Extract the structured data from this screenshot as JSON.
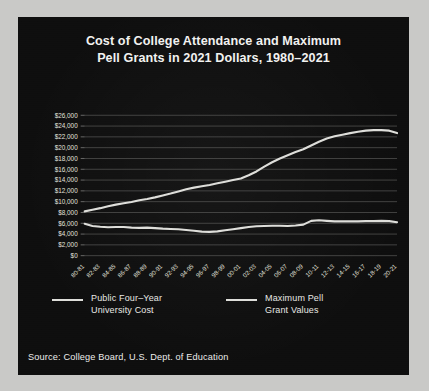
{
  "figure": {
    "border_color": "#c9c9c7",
    "background_color": "#0d0d0d"
  },
  "title": {
    "line1": "Cost of College Attendance and Maximum",
    "line2": "Pell Grants in 2021 Dollars, 1980–2021"
  },
  "source": "Source: College Board, U.S. Dept. of Education",
  "legend": {
    "items": [
      {
        "label_line1": "Public Four–Year",
        "label_line2": "University Cost",
        "color": "#dedeDa"
      },
      {
        "label_line1": "Maximum Pell",
        "label_line2": "Grant Values",
        "color": "#dedeDa"
      }
    ]
  },
  "chart_data": {
    "type": "line",
    "title": "Cost of College Attendance and Maximum Pell Grants in 2021 Dollars, 1980–2021",
    "xlabel": "",
    "ylabel": "",
    "ylim": [
      0,
      26000
    ],
    "ytick_values": [
      0,
      2000,
      4000,
      6000,
      8000,
      10000,
      12000,
      14000,
      16000,
      18000,
      20000,
      22000,
      24000,
      26000
    ],
    "ytick_labels": [
      "$0",
      "$2,000",
      "$4,000",
      "$6,000",
      "$8,000",
      "$10,000",
      "$12,000",
      "$14,000",
      "$16,000",
      "$18,000",
      "$20,000",
      "$22,000",
      "$24,000",
      "$26,000"
    ],
    "grid": true,
    "legend_position": "below-axes",
    "categories": [
      "80-81",
      "81-82",
      "82-83",
      "83-84",
      "84-85",
      "85-86",
      "86-87",
      "87-88",
      "88-89",
      "89-90",
      "90-91",
      "91-92",
      "92-93",
      "93-94",
      "94-95",
      "95-96",
      "96-97",
      "97-98",
      "98-99",
      "99-00",
      "00-01",
      "01-02",
      "02-03",
      "03-04",
      "04-05",
      "05-06",
      "06-07",
      "07-08",
      "08-09",
      "09-10",
      "10-11",
      "11-12",
      "12-13",
      "13-14",
      "14-15",
      "15-16",
      "16-17",
      "17-18",
      "18-19",
      "19-20",
      "20-21"
    ],
    "xtick_labels": [
      "80-81",
      "82-83",
      "84-85",
      "86-87",
      "88-89",
      "90-91",
      "92-93",
      "94-95",
      "96-97",
      "98-99",
      "00-01",
      "02-03",
      "04-05",
      "06-07",
      "08-09",
      "10-11",
      "12-13",
      "14-15",
      "16-17",
      "18-19",
      "20-21"
    ],
    "series": [
      {
        "name": "Public Four-Year University Cost",
        "color": "#dedeDa",
        "values": [
          8200,
          8500,
          8800,
          9150,
          9450,
          9700,
          9950,
          10250,
          10500,
          10800,
          11150,
          11500,
          11900,
          12300,
          12600,
          12850,
          13100,
          13400,
          13700,
          14000,
          14300,
          14900,
          15600,
          16500,
          17300,
          18000,
          18600,
          19200,
          19700,
          20400,
          21100,
          21700,
          22100,
          22400,
          22700,
          22950,
          23150,
          23250,
          23250,
          23150,
          22700
        ]
      },
      {
        "name": "Maximum Pell Grant Values",
        "color": "#dedeDa",
        "values": [
          5900,
          5500,
          5350,
          5250,
          5300,
          5300,
          5200,
          5150,
          5200,
          5100,
          5000,
          4950,
          4900,
          4750,
          4600,
          4450,
          4400,
          4500,
          4700,
          4900,
          5100,
          5300,
          5450,
          5500,
          5550,
          5550,
          5500,
          5600,
          5750,
          6450,
          6550,
          6450,
          6350,
          6350,
          6350,
          6350,
          6400,
          6400,
          6450,
          6400,
          6200
        ]
      }
    ]
  }
}
